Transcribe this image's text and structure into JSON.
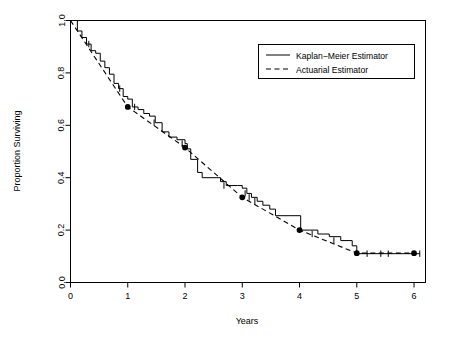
{
  "chart_data": {
    "type": "line",
    "title": "",
    "xlabel": "Years",
    "ylabel": "Proportion Surviving",
    "xlim": [
      0,
      6.2
    ],
    "ylim": [
      0.0,
      1.0
    ],
    "xticks": [
      0,
      1,
      2,
      3,
      4,
      5,
      6
    ],
    "xticklabels": [
      "0",
      "1",
      "2",
      "3",
      "4",
      "5",
      "6"
    ],
    "yticks": [
      0.0,
      0.2,
      0.4,
      0.6,
      0.8,
      1.0
    ],
    "yticklabels": [
      "0.0",
      "0.2",
      "0.4",
      "0.6",
      "0.8",
      "1.0"
    ],
    "grid": false,
    "legend_position": "upper right",
    "series": [
      {
        "name": "Kaplan-Meier Estimator",
        "style": "solid",
        "marker": "none",
        "step": "post",
        "x": [
          0.0,
          0.06,
          0.12,
          0.2,
          0.28,
          0.36,
          0.44,
          0.52,
          0.6,
          0.68,
          0.76,
          0.84,
          0.92,
          1.0,
          1.08,
          1.18,
          1.28,
          1.38,
          1.48,
          1.6,
          1.72,
          1.86,
          2.0,
          2.04,
          2.1,
          2.22,
          2.3,
          2.62,
          2.72,
          2.82,
          2.92,
          3.0,
          3.08,
          3.16,
          3.26,
          3.36,
          3.48,
          3.58,
          4.02,
          4.18,
          4.32,
          4.52,
          4.72,
          4.92,
          5.0,
          6.1
        ],
        "y": [
          1.0,
          1.0,
          0.96,
          0.935,
          0.91,
          0.885,
          0.875,
          0.845,
          0.82,
          0.795,
          0.76,
          0.74,
          0.71,
          0.7,
          0.67,
          0.66,
          0.645,
          0.635,
          0.61,
          0.575,
          0.555,
          0.545,
          0.53,
          0.51,
          0.47,
          0.42,
          0.4,
          0.385,
          0.37,
          0.37,
          0.37,
          0.36,
          0.34,
          0.325,
          0.31,
          0.295,
          0.28,
          0.255,
          0.2,
          0.2,
          0.185,
          0.175,
          0.16,
          0.14,
          0.11,
          0.11
        ]
      },
      {
        "name": "Actuarial Estimator",
        "style": "dashed",
        "marker": "filled-circle",
        "x": [
          0.0,
          1.0,
          2.0,
          3.0,
          4.0,
          5.0,
          6.0
        ],
        "y": [
          1.0,
          0.67,
          0.515,
          0.325,
          0.2,
          0.112,
          0.112
        ]
      }
    ],
    "censor_marks": {
      "description": "Plus-shaped censoring ticks on the Kaplan-Meier step curve",
      "x": [
        0.32,
        0.86,
        1.12,
        1.46,
        1.95,
        2.68,
        3.05,
        3.12,
        3.22,
        4.22,
        4.6,
        5.18,
        5.42,
        5.55,
        6.1
      ],
      "y": [
        0.91,
        0.74,
        0.67,
        0.61,
        0.53,
        0.37,
        0.34,
        0.325,
        0.31,
        0.185,
        0.16,
        0.11,
        0.11,
        0.11,
        0.11
      ]
    },
    "annotations": []
  },
  "legend": {
    "entries": [
      {
        "label": "Kaplan−Meier Estimator",
        "style": "solid"
      },
      {
        "label": "Actuarial Estimator",
        "style": "dashed"
      }
    ]
  }
}
